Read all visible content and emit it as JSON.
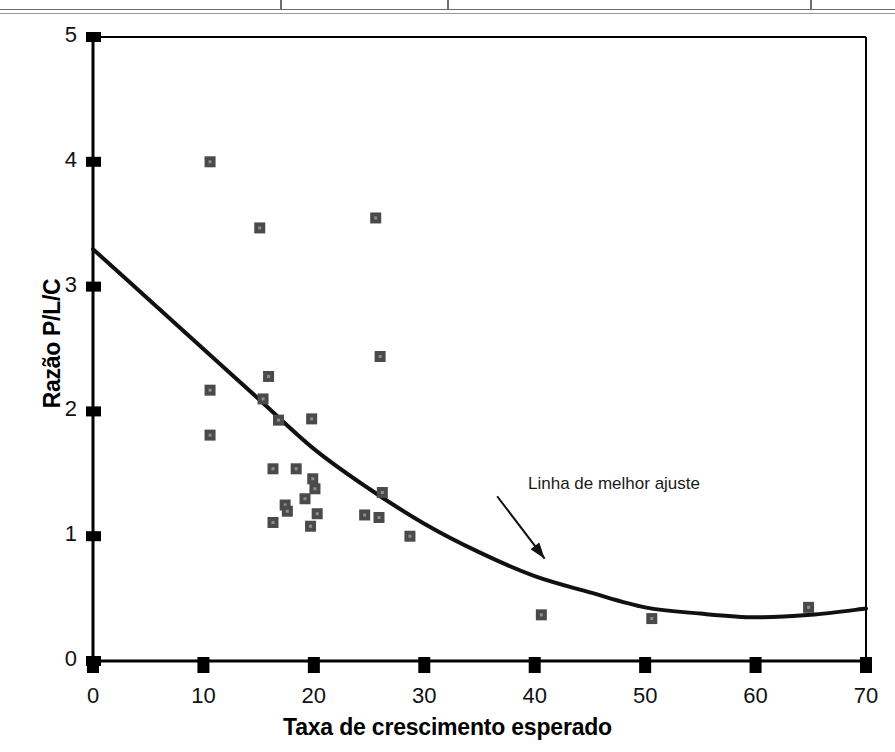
{
  "figure": {
    "top_rule_present": true,
    "top_rule_divider_x": [
      280,
      447,
      810
    ],
    "background_color": "#ffffff",
    "axis_color": "#000000",
    "marker_color": "#4a4a4a",
    "fitline_color": "#111111"
  },
  "chart_data": {
    "type": "scatter",
    "title": "",
    "xlabel": "Taxa de crescimento esperado",
    "ylabel": "Razão P/L/C",
    "xlim": [
      0,
      70
    ],
    "ylim": [
      0,
      5
    ],
    "xticks": [
      0,
      10,
      20,
      30,
      40,
      50,
      60,
      70
    ],
    "yticks": [
      0,
      1,
      2,
      3,
      4,
      5
    ],
    "xtick_labels": [
      "0",
      "10",
      "20",
      "30",
      "40",
      "50",
      "60",
      "70"
    ],
    "ytick_labels": [
      "0",
      "1",
      "2",
      "3",
      "4",
      "5"
    ],
    "grid": false,
    "legend": null,
    "points": [
      {
        "x": 10.6,
        "y": 4.0
      },
      {
        "x": 15.1,
        "y": 3.47
      },
      {
        "x": 25.6,
        "y": 3.55
      },
      {
        "x": 26.0,
        "y": 2.44
      },
      {
        "x": 10.6,
        "y": 2.17
      },
      {
        "x": 10.6,
        "y": 1.81
      },
      {
        "x": 15.9,
        "y": 2.28
      },
      {
        "x": 15.4,
        "y": 2.1
      },
      {
        "x": 16.8,
        "y": 1.93
      },
      {
        "x": 19.8,
        "y": 1.94
      },
      {
        "x": 16.3,
        "y": 1.54
      },
      {
        "x": 18.4,
        "y": 1.54
      },
      {
        "x": 19.9,
        "y": 1.46
      },
      {
        "x": 20.1,
        "y": 1.38
      },
      {
        "x": 19.2,
        "y": 1.3
      },
      {
        "x": 17.4,
        "y": 1.25
      },
      {
        "x": 17.6,
        "y": 1.2
      },
      {
        "x": 20.3,
        "y": 1.18
      },
      {
        "x": 26.2,
        "y": 1.35
      },
      {
        "x": 24.6,
        "y": 1.17
      },
      {
        "x": 25.9,
        "y": 1.15
      },
      {
        "x": 16.3,
        "y": 1.11
      },
      {
        "x": 19.7,
        "y": 1.08
      },
      {
        "x": 28.7,
        "y": 1.0
      },
      {
        "x": 40.6,
        "y": 0.37
      },
      {
        "x": 50.6,
        "y": 0.34
      },
      {
        "x": 64.8,
        "y": 0.43
      }
    ],
    "fit_line": {
      "label": "Linha de melhor ajuste",
      "points": [
        {
          "x": 0.0,
          "y": 3.3
        },
        {
          "x": 5.0,
          "y": 2.9
        },
        {
          "x": 10.0,
          "y": 2.5
        },
        {
          "x": 15.0,
          "y": 2.1
        },
        {
          "x": 20.0,
          "y": 1.7
        },
        {
          "x": 25.0,
          "y": 1.38
        },
        {
          "x": 30.0,
          "y": 1.1
        },
        {
          "x": 35.0,
          "y": 0.87
        },
        {
          "x": 40.0,
          "y": 0.68
        },
        {
          "x": 45.0,
          "y": 0.55
        },
        {
          "x": 50.0,
          "y": 0.43
        },
        {
          "x": 55.0,
          "y": 0.38
        },
        {
          "x": 60.0,
          "y": 0.35
        },
        {
          "x": 65.0,
          "y": 0.37
        },
        {
          "x": 70.0,
          "y": 0.42
        }
      ]
    },
    "annotations": [
      {
        "text": "Linha de melhor ajuste",
        "text_x": 39.4,
        "text_y": 1.56,
        "arrow_from": {
          "x": 36.6,
          "y": 1.32
        },
        "arrow_to": {
          "x": 40.9,
          "y": 0.82
        }
      }
    ]
  }
}
